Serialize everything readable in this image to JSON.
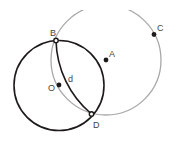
{
  "diagram": {
    "type": "geometry-construction",
    "colors": {
      "primary_stroke": "#1e1a1a",
      "secondary_stroke": "#a8a8a8",
      "point_fill": "#1e1a1a",
      "label": "#444444",
      "background": "#ffffff"
    },
    "points": [
      {
        "name": "B",
        "label": "B",
        "x": 56,
        "y": 40.5,
        "style": "ring"
      },
      {
        "name": "D",
        "label": "D",
        "x": 91.5,
        "y": 114,
        "style": "ring"
      },
      {
        "name": "O",
        "label": "O",
        "x": 59,
        "y": 85,
        "style": "dot"
      },
      {
        "name": "A",
        "label": "A",
        "x": 106,
        "y": 60,
        "style": "dot"
      },
      {
        "name": "C",
        "label": "C",
        "x": 154,
        "y": 34.5,
        "style": "dot"
      }
    ],
    "circles": [
      {
        "name": "circle-O",
        "center": "O",
        "cx": 59,
        "cy": 85.5,
        "r": 45,
        "stroke": "dark"
      },
      {
        "name": "circle-A",
        "center": "A",
        "cx": 106,
        "cy": 60,
        "r": 55,
        "stroke": "light",
        "clipped_top": true
      }
    ],
    "arcs": [
      {
        "name": "arc-d",
        "label": "d",
        "from": "B",
        "to": "D",
        "r": 99,
        "stroke": "dark"
      }
    ],
    "labels": {
      "B": "B",
      "D": "D",
      "O": "O",
      "A": "A",
      "C": "C",
      "d": "d"
    }
  }
}
